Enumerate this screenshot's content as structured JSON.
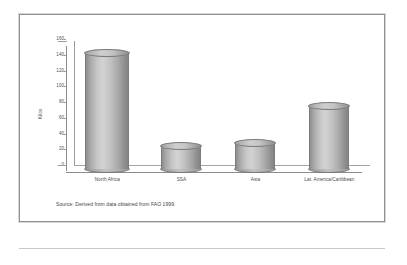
{
  "figure": {
    "source_note": "Source: Derived from data obtained from FAO 1999."
  },
  "chart_data": {
    "type": "bar",
    "title": "",
    "subtitle": "",
    "xlabel": "",
    "ylabel": "Kilos",
    "categories": [
      "North Africa",
      "SSA",
      "Asia",
      "Lat. America/Caribbean"
    ],
    "values": [
      147,
      29,
      32,
      80
    ],
    "ylim": [
      0,
      160
    ],
    "yticks": [
      0,
      20,
      40,
      60,
      80,
      100,
      120,
      140,
      160
    ],
    "ytick_labels": [
      "0",
      "20",
      "40",
      "60",
      "80",
      "100",
      "120",
      "140",
      "160"
    ],
    "grid": false,
    "legend": null,
    "style": "3d-cylinder-grayscale",
    "annotations": []
  },
  "colors": {
    "frame_border": "#8f8f8f",
    "axis_line": "#8c8c8c",
    "bar_light": "#d3d3d3",
    "bar_dark": "#848484",
    "text": "#4a4a4a"
  }
}
